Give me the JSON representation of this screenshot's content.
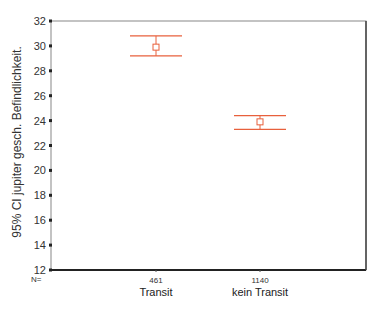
{
  "chart_data": {
    "type": "errorbar",
    "title": "",
    "xlabel": "",
    "ylabel": "95% CI jupiter gesch. Befindlichkeit.",
    "ylim": [
      12,
      32
    ],
    "yticks": [
      12,
      14,
      16,
      18,
      20,
      22,
      24,
      26,
      28,
      30,
      32
    ],
    "grid": false,
    "n_label": "N=",
    "categories": [
      "Transit",
      "kein Transit"
    ],
    "n": [
      "461",
      "1140"
    ],
    "series": [
      {
        "name": "95% CI",
        "color": "#e8603c",
        "mean": [
          29.9,
          23.9
        ],
        "lower": [
          29.2,
          23.3
        ],
        "upper": [
          30.8,
          24.4
        ]
      }
    ]
  }
}
